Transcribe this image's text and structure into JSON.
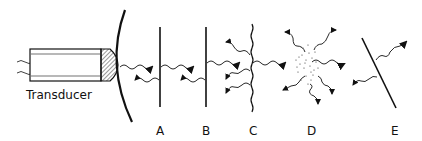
{
  "diagram": {
    "transducer_label": "Transducer",
    "labels": [
      "A",
      "B",
      "C",
      "D",
      "E"
    ],
    "colors": {
      "ink": "#111111",
      "background": "#ffffff",
      "hatch": "#555555"
    }
  }
}
